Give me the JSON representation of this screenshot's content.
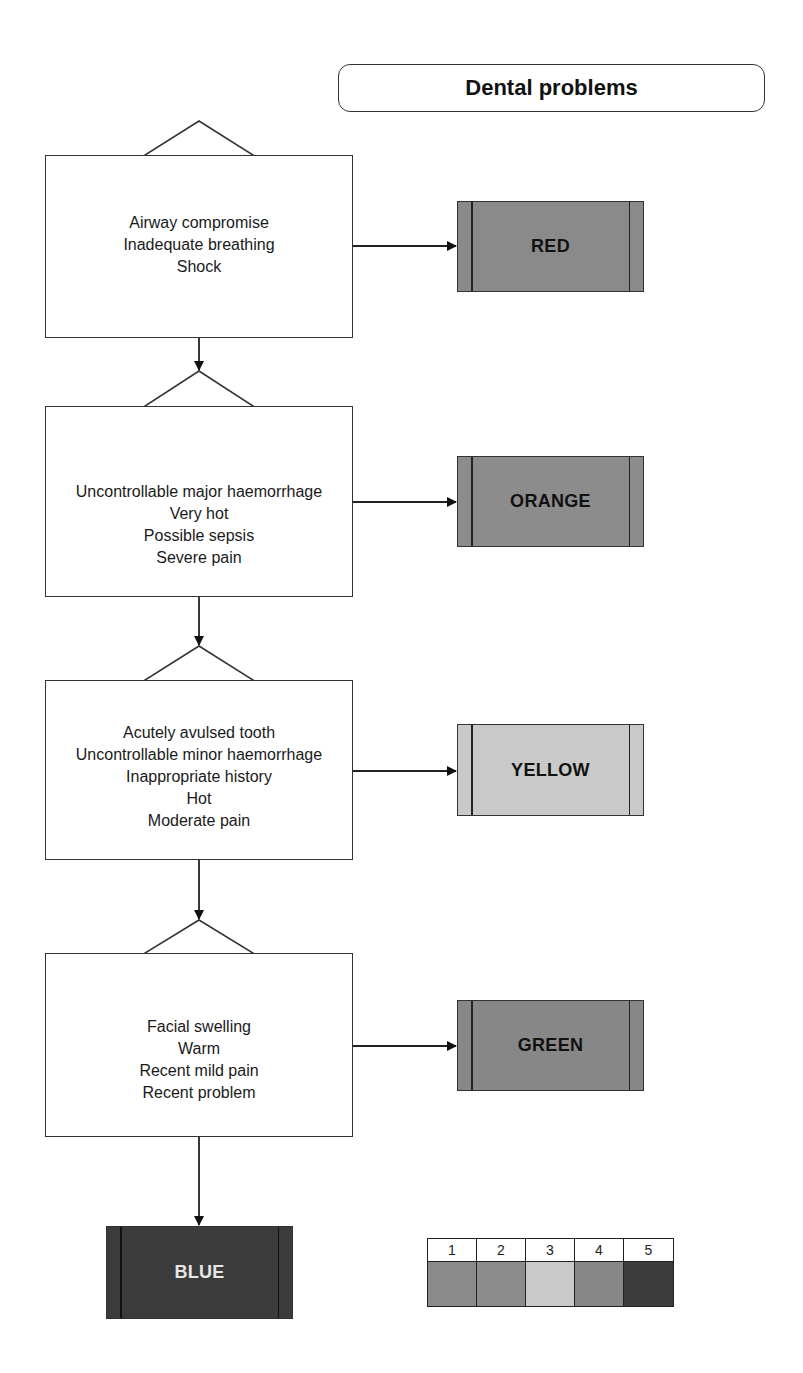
{
  "title": "Dental problems",
  "flow": {
    "levels": [
      {
        "discriminators": [
          "Airway compromise",
          "Inadequate breathing",
          "Shock"
        ],
        "outcome": {
          "label": "RED",
          "fill": "#8a8a8a",
          "text_color": "#111111"
        }
      },
      {
        "discriminators": [
          "Uncontrollable major haemorrhage",
          "Very hot",
          "Possible sepsis",
          "Severe pain"
        ],
        "outcome": {
          "label": "ORANGE",
          "fill": "#8c8c8c",
          "text_color": "#111111"
        }
      },
      {
        "discriminators": [
          "Acutely avulsed tooth",
          "Uncontrollable minor haemorrhage",
          "Inappropriate history",
          "Hot",
          "Moderate pain"
        ],
        "outcome": {
          "label": "YELLOW",
          "fill": "#c9c9c9",
          "text_color": "#111111"
        }
      },
      {
        "discriminators": [
          "Facial swelling",
          "Warm",
          "Recent mild pain",
          "Recent problem"
        ],
        "outcome": {
          "label": "GREEN",
          "fill": "#878787",
          "text_color": "#111111"
        }
      }
    ],
    "default_outcome": {
      "label": "BLUE",
      "fill": "#3b3b3b",
      "text_color": "#e6e6e6"
    }
  },
  "legend": {
    "items": [
      {
        "number": "1",
        "fill": "#8a8a8a"
      },
      {
        "number": "2",
        "fill": "#8c8c8c"
      },
      {
        "number": "3",
        "fill": "#c9c9c9"
      },
      {
        "number": "4",
        "fill": "#878787"
      },
      {
        "number": "5",
        "fill": "#3b3b3b"
      }
    ]
  },
  "colors": {
    "line": "#222222",
    "box_border": "#333333",
    "background": "#ffffff"
  }
}
